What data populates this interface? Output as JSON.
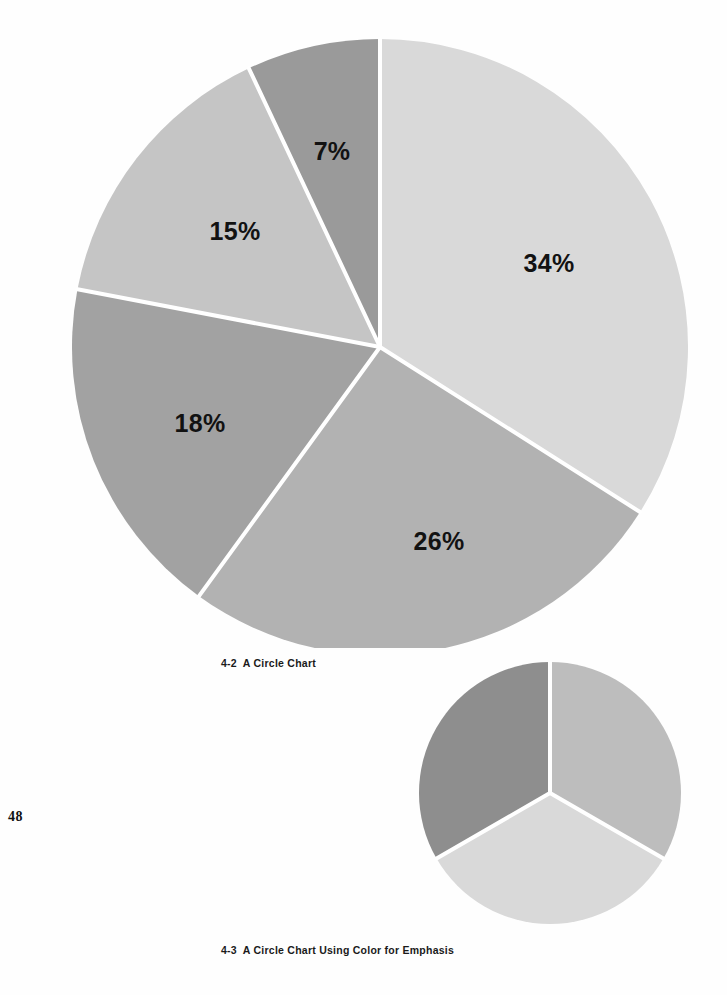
{
  "page": {
    "folio": "48",
    "background_color": "#fefefe"
  },
  "figures": [
    {
      "id": "figure-4-2",
      "caption": "4-2  A Circle Chart",
      "caption_number": "4-2",
      "caption_text": "A Circle Chart"
    },
    {
      "id": "figure-4-3",
      "caption": "4-3  A Circle Chart Using Color for Emphasis",
      "caption_number": "4-3",
      "caption_text": "A Circle Chart Using Color for Emphasis"
    }
  ],
  "chart_data": [
    {
      "type": "pie",
      "id": "figure-4-2",
      "title": "4-2  A Circle Chart",
      "categories": [
        "Segment 1",
        "Segment 2",
        "Segment 3",
        "Segment 4",
        "Segment 5"
      ],
      "values": [
        34,
        26,
        18,
        15,
        7
      ],
      "labels": [
        "34%",
        "26%",
        "18%",
        "15%",
        "7%"
      ],
      "unit": "percent",
      "total": 100,
      "start_angle_deg": 0,
      "direction": "clockwise",
      "separator_color": "#ffffff",
      "separator_width_px": 4,
      "colors": [
        "#d9d9d9",
        "#b2b2b2",
        "#a2a2a2",
        "#c5c5c5",
        "#9a9a9a"
      ],
      "label_color": "#121212",
      "legend": "none",
      "grid": false
    },
    {
      "type": "pie",
      "id": "figure-4-3",
      "title": "4-3  A Circle Chart Using Color for Emphasis",
      "categories": [
        "Segment A",
        "Segment B",
        "Segment C"
      ],
      "values": [
        33.3,
        33.3,
        33.3
      ],
      "labels": [
        "",
        "",
        ""
      ],
      "unit": "percent",
      "total": 100,
      "start_angle_deg": 0,
      "direction": "clockwise",
      "separator_color": "#ffffff",
      "separator_width_px": 4,
      "colors": [
        "#bdbdbd",
        "#d9d9d9",
        "#8e8e8e"
      ],
      "legend": "none",
      "grid": false
    }
  ]
}
